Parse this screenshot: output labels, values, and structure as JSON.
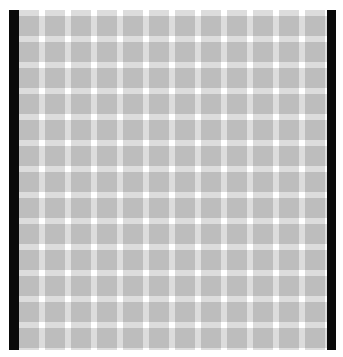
{
  "image": {
    "description": "Gray grid pattern framed by black vertical bars (optical illusion grid)",
    "colors": {
      "background": "#ffffff",
      "frame_bars": "#0a0a0a",
      "cell_fill": "#bdbdbd",
      "band_fill": "#dcdcdc",
      "intersection": "#ffffff"
    },
    "grid": {
      "columns": 12,
      "rows": 13,
      "period_px": 26,
      "band_px": 6
    }
  }
}
